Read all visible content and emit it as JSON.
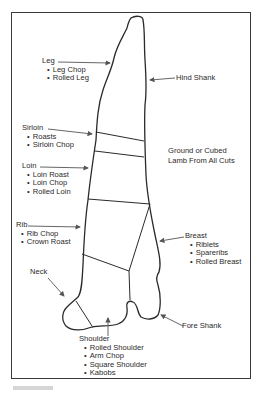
{
  "diagram": {
    "note": {
      "line1": "Ground or Cubed",
      "line2": "Lamb From All Cuts"
    },
    "cuts": [
      {
        "name": "Leg",
        "items": [
          "Leg Chop",
          "Rolled Leg"
        ]
      },
      {
        "name": "Hind Shank",
        "items": []
      },
      {
        "name": "Sirloin",
        "items": [
          "Roasts",
          "Sirloin Chop"
        ]
      },
      {
        "name": "Loin",
        "items": [
          "Loin Roast",
          "Loin Chop",
          "Rolled Loin"
        ]
      },
      {
        "name": "Rib",
        "items": [
          "Rib Chop",
          "Crown Roast"
        ]
      },
      {
        "name": "Breast",
        "items": [
          "Riblets",
          "Spareribs",
          "Rolled Breast"
        ]
      },
      {
        "name": "Neck",
        "items": []
      },
      {
        "name": "Fore Shank",
        "items": []
      },
      {
        "name": "Shoulder",
        "items": [
          "Rolled Shoulder",
          "Arm Chop",
          "Square Shoulder",
          "Kabobs"
        ]
      }
    ],
    "colors": {
      "line": "#2a2a2a",
      "arrow": "#555555",
      "frame": "#3a3a3a"
    }
  }
}
